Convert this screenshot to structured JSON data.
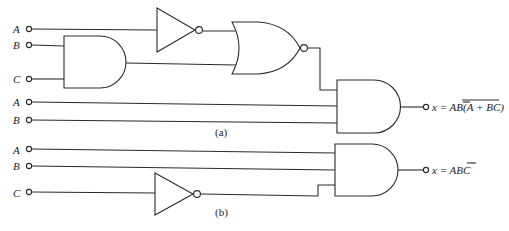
{
  "circuit_a": {
    "caption": "(a)",
    "inputs": [
      {
        "label": "A",
        "y": 29
      },
      {
        "label": "B",
        "y": 45
      },
      {
        "label": "C",
        "y": 79
      },
      {
        "label": "A",
        "y": 102
      },
      {
        "label": "B",
        "y": 120
      }
    ],
    "gates": [
      "NOT",
      "AND",
      "NOR",
      "AND"
    ],
    "output": {
      "prefix": "x = AB(",
      "overlined": "A + BC",
      "inner_overlined": "A",
      "suffix": ")"
    }
  },
  "circuit_b": {
    "caption": "(b)",
    "inputs": [
      {
        "label": "A",
        "y": 150
      },
      {
        "label": "B",
        "y": 166
      },
      {
        "label": "C",
        "y": 193
      }
    ],
    "gates": [
      "NOT",
      "AND"
    ],
    "output": {
      "prefix": "x = AB",
      "overlined": "C"
    }
  }
}
